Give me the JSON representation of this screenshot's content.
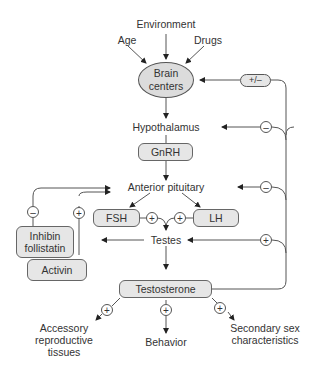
{
  "inputs": {
    "environment": "Environment",
    "age": "Age",
    "drugs": "Drugs"
  },
  "nodes": {
    "brain_centers": "Brain centers",
    "hypothalamus": "Hypothalamus",
    "gnrh": "GnRH",
    "anterior_pituitary": "Anterior pituitary",
    "fsh": "FSH",
    "lh": "LH",
    "testes": "Testes",
    "testosterone": "Testosterone",
    "inhibin_follistatin": "Inhibin follistatin",
    "activin": "Activin"
  },
  "outputs": {
    "accessory": "Accessory reproductive tissues",
    "behavior": "Behavior",
    "secondary": "Secondary sex characteristics"
  },
  "signs": {
    "feedback_brain": "+/–",
    "feedback_hypothalamus": "–",
    "feedback_pituitary": "–",
    "feedback_testes": "+",
    "inhibin": "–",
    "activin": "+",
    "fsh": "+",
    "lh": "+",
    "accessory": "+",
    "behavior": "+",
    "secondary": "+"
  },
  "colors": {
    "node_fill": "#e6e6e6",
    "ellipse_fill": "#dcdcdc",
    "line": "#555555",
    "text": "#333333"
  }
}
